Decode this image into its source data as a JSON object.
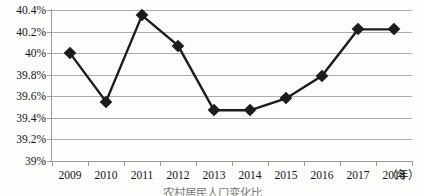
{
  "chart_data": {
    "type": "line",
    "title": "",
    "subtitle": "",
    "xlabel": "年",
    "ylabel": "",
    "categories": [
      "2009",
      "2010",
      "2011",
      "2012",
      "2013",
      "2014",
      "2015",
      "2016",
      "2017",
      "2018"
    ],
    "values": [
      40.0,
      39.55,
      40.35,
      40.07,
      39.47,
      39.47,
      39.58,
      39.79,
      40.22,
      40.22
    ],
    "value_labels": [
      "40%",
      "39.55%",
      "40.35%",
      "40.07%",
      "39.47%",
      "39.47%",
      "39.58%",
      "39.79%",
      "40.22%",
      "40.22%"
    ],
    "series": [
      {
        "name": "",
        "values": [
          40.0,
          39.55,
          40.35,
          40.07,
          39.47,
          39.47,
          39.58,
          39.79,
          40.22,
          40.22
        ]
      }
    ],
    "ylim": [
      39.0,
      40.4
    ],
    "yticks": [
      39.0,
      39.2,
      39.4,
      39.6,
      39.8,
      40.0,
      40.2,
      40.4
    ],
    "ytick_labels": [
      "39%",
      "39.2%",
      "39.4%",
      "39.6%",
      "39.8%",
      "40%",
      "40.2%",
      "40.4%"
    ],
    "xtick_labels": [
      "2009",
      "2010",
      "2011",
      "2012",
      "2013",
      "2014",
      "2015",
      "2016",
      "2017",
      "2018"
    ],
    "x_axis_unit": "（年）",
    "grid": "horizontal",
    "legend": "none",
    "line_color": "#1c1c1c",
    "marker": "diamond",
    "marker_color": "#1c1c1c",
    "gridline_color": "#adadad",
    "background_color": "#fdfdfc"
  },
  "caption": {
    "text": "农村居民人口变化比"
  }
}
